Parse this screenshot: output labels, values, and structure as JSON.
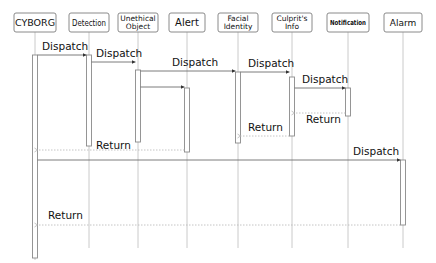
{
  "participants": [
    {
      "id": "cyborg",
      "lines": [
        "CYBORG"
      ]
    },
    {
      "id": "detection",
      "lines": [
        "Detection"
      ]
    },
    {
      "id": "unethical-object",
      "lines": [
        "Unethical",
        "Object"
      ]
    },
    {
      "id": "alert",
      "lines": [
        "Alert"
      ]
    },
    {
      "id": "facial-identity",
      "lines": [
        "Facial",
        "Identity"
      ]
    },
    {
      "id": "culprits-info",
      "lines": [
        "Culprit's",
        "Info"
      ]
    },
    {
      "id": "notification",
      "lines": [
        "Notification"
      ]
    },
    {
      "id": "alarm",
      "lines": [
        "Alarm"
      ]
    }
  ],
  "messages": [
    {
      "from": "cyborg",
      "to": "detection",
      "label": "Dispatch",
      "type": "call"
    },
    {
      "from": "detection",
      "to": "unethical-object",
      "label": "Dispatch",
      "type": "call"
    },
    {
      "from": "unethical-object",
      "to": "facial-identity",
      "label": "Dispatch",
      "type": "call"
    },
    {
      "from": "unethical-object",
      "to": "alert",
      "label": "",
      "type": "call"
    },
    {
      "from": "facial-identity",
      "to": "culprits-info",
      "label": "Dispatch",
      "type": "call"
    },
    {
      "from": "culprits-info",
      "to": "notification",
      "label": "Dispatch",
      "type": "call"
    },
    {
      "from": "notification",
      "to": "culprits-info",
      "label": "Return",
      "type": "return"
    },
    {
      "from": "culprits-info",
      "to": "facial-identity",
      "label": "Return",
      "type": "return"
    },
    {
      "from": "alert",
      "to": "cyborg",
      "label": "Return",
      "type": "return"
    },
    {
      "from": "cyborg",
      "to": "alarm",
      "label": "Dispatch",
      "type": "call"
    },
    {
      "from": "alarm",
      "to": "cyborg",
      "label": "Return",
      "type": "return"
    }
  ],
  "colors": {
    "box_border": "#8a8a8a",
    "lifeline": "#bdbdbd",
    "activation": "#8a8a8a",
    "call_line": "#6e6e6e",
    "return_line": "#b5b5b5",
    "text": "#111111"
  }
}
